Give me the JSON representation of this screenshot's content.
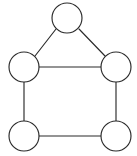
{
  "figure": {
    "background_color": "#ffffff",
    "stroke_color": "#2b2b2b",
    "node_fill_color": "#ffffff",
    "stroke_width": 1.15,
    "node_radius": 15,
    "canvas": {
      "width": 137,
      "height": 156
    }
  },
  "chart_data": {
    "type": "diagram",
    "graph_kind": "undirected",
    "node_count": 5,
    "edge_count": 6,
    "title": "",
    "xlabel": "",
    "ylabel": "",
    "grid": false,
    "legend": "none",
    "nodes": [
      {
        "id": "apex",
        "label": "",
        "cx": 67,
        "cy": 18,
        "r": 15,
        "degree": 2
      },
      {
        "id": "left-upper",
        "label": "",
        "cx": 24,
        "cy": 67,
        "r": 15,
        "degree": 3
      },
      {
        "id": "right-upper",
        "label": "",
        "cx": 116,
        "cy": 67,
        "r": 15,
        "degree": 3
      },
      {
        "id": "left-lower",
        "label": "",
        "cx": 24,
        "cy": 136,
        "r": 15,
        "degree": 2
      },
      {
        "id": "right-lower",
        "label": "",
        "cx": 116,
        "cy": 136,
        "r": 15,
        "degree": 2
      }
    ],
    "edges": [
      {
        "id": "apex-left-upper",
        "source": "apex",
        "target": "left-upper",
        "x1": 56,
        "y1": 29,
        "x2": 35,
        "y2": 56,
        "orientation": "diagonal"
      },
      {
        "id": "apex-right-upper",
        "source": "apex",
        "target": "right-upper",
        "x1": 79,
        "y1": 29,
        "x2": 105,
        "y2": 56,
        "orientation": "diagonal"
      },
      {
        "id": "left-upper-right-upper",
        "source": "left-upper",
        "target": "right-upper",
        "x1": 39,
        "y1": 67,
        "x2": 101,
        "y2": 67,
        "orientation": "horizontal"
      },
      {
        "id": "left-upper-left-lower",
        "source": "left-upper",
        "target": "left-lower",
        "x1": 24,
        "y1": 82,
        "x2": 24,
        "y2": 121,
        "orientation": "vertical"
      },
      {
        "id": "right-upper-right-lower",
        "source": "right-upper",
        "target": "right-lower",
        "x1": 116,
        "y1": 82,
        "x2": 116,
        "y2": 121,
        "orientation": "vertical"
      },
      {
        "id": "left-lower-right-lower",
        "source": "left-lower",
        "target": "right-lower",
        "x1": 39,
        "y1": 136,
        "x2": 101,
        "y2": 136,
        "orientation": "horizontal"
      }
    ]
  }
}
